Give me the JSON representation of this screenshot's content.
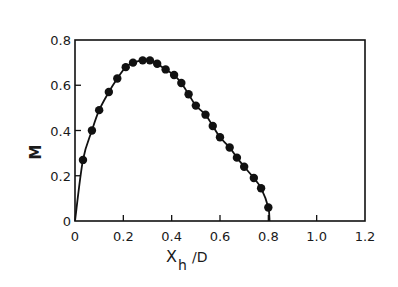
{
  "chart_data": {
    "type": "line",
    "title": "",
    "xlabel": "x_h / D",
    "xlabel_main": "X",
    "xlabel_sub": "h",
    "xlabel_suffix": "/D",
    "ylabel": "M",
    "xlim": [
      0,
      1.2
    ],
    "ylim": [
      0,
      0.8
    ],
    "grid": false,
    "legend": null,
    "x_ticks": [
      0,
      0.2,
      0.4,
      0.6,
      0.8,
      1.0,
      1.2
    ],
    "x_tick_labels": [
      "0",
      "0.2",
      "0.4",
      "0.6",
      "0.8",
      "1.0",
      "1.2"
    ],
    "y_ticks": [
      0,
      0.2,
      0.4,
      0.6,
      0.8
    ],
    "y_tick_labels": [
      "0",
      "0.2",
      "0.4",
      "0.6",
      "0.8"
    ],
    "series": [
      {
        "name": "M vs x_h/D",
        "style": "solid line with filled circular markers",
        "color": "#111111",
        "x": [
          0.0,
          0.033,
          0.07,
          0.1,
          0.14,
          0.175,
          0.21,
          0.24,
          0.28,
          0.31,
          0.34,
          0.375,
          0.41,
          0.44,
          0.47,
          0.5,
          0.54,
          0.57,
          0.6,
          0.64,
          0.67,
          0.7,
          0.74,
          0.77,
          0.8,
          0.805
        ],
        "y": [
          0.0,
          0.27,
          0.4,
          0.49,
          0.57,
          0.63,
          0.68,
          0.7,
          0.71,
          0.71,
          0.695,
          0.67,
          0.645,
          0.61,
          0.56,
          0.51,
          0.47,
          0.42,
          0.37,
          0.325,
          0.28,
          0.24,
          0.19,
          0.145,
          0.06,
          0.0
        ],
        "markers": [
          false,
          true,
          true,
          true,
          true,
          true,
          true,
          true,
          true,
          true,
          true,
          true,
          true,
          true,
          true,
          true,
          true,
          true,
          true,
          true,
          true,
          true,
          true,
          true,
          true,
          false
        ]
      }
    ]
  },
  "colors": {
    "ink": "#111111",
    "background": "#ffffff"
  }
}
